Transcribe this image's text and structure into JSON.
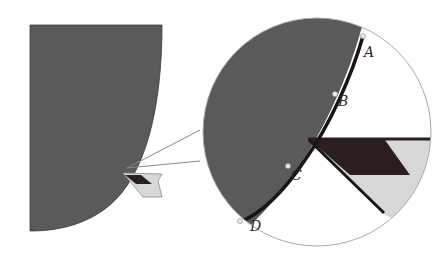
{
  "diagram": {
    "colors": {
      "body_fill": "#5a5a5a",
      "contact_edge": "#1a1414",
      "insert_dark": "#2a1e1e",
      "insert_light": "#d8d8d8",
      "outline": "#9a9a9a",
      "background": "#ffffff"
    },
    "points": [
      {
        "id": "A",
        "label": "A"
      },
      {
        "id": "B",
        "label": "B"
      },
      {
        "id": "C",
        "label": "C"
      },
      {
        "id": "D",
        "label": "D"
      }
    ]
  }
}
